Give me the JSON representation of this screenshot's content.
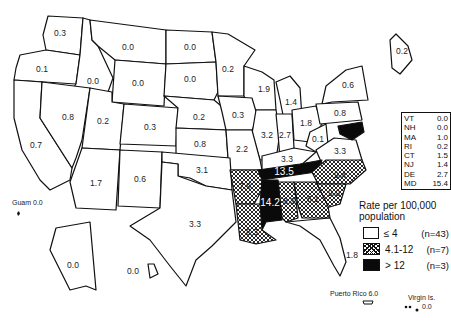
{
  "map": {
    "title": "Rate per 100,000 population by state",
    "states": [
      {
        "id": "WA",
        "value": "0.3",
        "category": "low"
      },
      {
        "id": "OR",
        "value": "0.1",
        "category": "low"
      },
      {
        "id": "ID",
        "value": "0.0",
        "category": "low"
      },
      {
        "id": "MT",
        "value": "0.0",
        "category": "low"
      },
      {
        "id": "WY",
        "value": "0.0",
        "category": "low"
      },
      {
        "id": "ND",
        "value": "0.0",
        "category": "low"
      },
      {
        "id": "SD",
        "value": "0.0",
        "category": "low"
      },
      {
        "id": "MN",
        "value": "0.2",
        "category": "low"
      },
      {
        "id": "WI",
        "value": "1.9",
        "category": "low"
      },
      {
        "id": "MI",
        "value": "1.4",
        "category": "low"
      },
      {
        "id": "NY",
        "value": "0.6",
        "category": "low"
      },
      {
        "id": "ME",
        "value": "0.2",
        "category": "low"
      },
      {
        "id": "CA",
        "value": "0.7",
        "category": "low"
      },
      {
        "id": "NV",
        "value": "0.8",
        "category": "low"
      },
      {
        "id": "UT",
        "value": "0.2",
        "category": "low"
      },
      {
        "id": "CO",
        "value": "0.3",
        "category": "low"
      },
      {
        "id": "NE",
        "value": "0.2",
        "category": "low"
      },
      {
        "id": "IA",
        "value": "0.3",
        "category": "low"
      },
      {
        "id": "IL",
        "value": "3.2",
        "category": "low"
      },
      {
        "id": "IN",
        "value": "2.7",
        "category": "low"
      },
      {
        "id": "OH",
        "value": "1.8",
        "category": "low"
      },
      {
        "id": "PA",
        "value": "0.8",
        "category": "low"
      },
      {
        "id": "WV",
        "value": "0.1",
        "category": "low"
      },
      {
        "id": "VA",
        "value": "3.3",
        "category": "low"
      },
      {
        "id": "KS",
        "value": "0.8",
        "category": "low"
      },
      {
        "id": "MO",
        "value": "2.2",
        "category": "low"
      },
      {
        "id": "KY",
        "value": "3.3",
        "category": "low"
      },
      {
        "id": "AZ",
        "value": "1.7",
        "category": "low"
      },
      {
        "id": "NM",
        "value": "0.6",
        "category": "low"
      },
      {
        "id": "OK",
        "value": "3.1",
        "category": "low"
      },
      {
        "id": "TX",
        "value": "3.3",
        "category": "low"
      },
      {
        "id": "AR",
        "value": "7.9",
        "category": "mid"
      },
      {
        "id": "TN",
        "value": "13.5",
        "category": "high"
      },
      {
        "id": "NC",
        "value": "9.4",
        "category": "mid"
      },
      {
        "id": "SC",
        "value": "9.0",
        "category": "mid"
      },
      {
        "id": "GA",
        "value": "5.1",
        "category": "mid"
      },
      {
        "id": "AL",
        "value": "8.2",
        "category": "mid"
      },
      {
        "id": "MS",
        "value": "14.2",
        "category": "high"
      },
      {
        "id": "LA",
        "value": "8.3",
        "category": "mid"
      },
      {
        "id": "FL",
        "value": "1.8",
        "category": "low"
      },
      {
        "id": "AK",
        "value": "0.0",
        "category": "low"
      },
      {
        "id": "HI",
        "value": "0.0",
        "category": "low"
      },
      {
        "id": "MD",
        "value": "15.4",
        "category": "high"
      }
    ],
    "northeast_table": [
      {
        "state": "VT",
        "value": "0.0"
      },
      {
        "state": "NH",
        "value": "0.0"
      },
      {
        "state": "MA",
        "value": "1.0"
      },
      {
        "state": "RI",
        "value": "0.2"
      },
      {
        "state": "CT",
        "value": "1.5"
      },
      {
        "state": "NJ",
        "value": "1.4"
      },
      {
        "state": "DE",
        "value": "2.7"
      },
      {
        "state": "MD",
        "value": "15.4"
      }
    ],
    "territories": {
      "guam": {
        "label": "Guam",
        "value": "0.0"
      },
      "puerto_rico": {
        "label": "Puerto Rico",
        "value": "6.0"
      },
      "virgin_islands": {
        "label": "Virgin Is.",
        "value": "0.0"
      }
    },
    "legend": {
      "title": "Rate per 100,000 population",
      "items": [
        {
          "category": "low",
          "range": "≤ 4",
          "count": "(n=43)"
        },
        {
          "category": "mid",
          "range": "4.1-12",
          "count": "(n=7)"
        },
        {
          "category": "high",
          "range": "> 12",
          "count": "(n=3)"
        }
      ]
    }
  }
}
